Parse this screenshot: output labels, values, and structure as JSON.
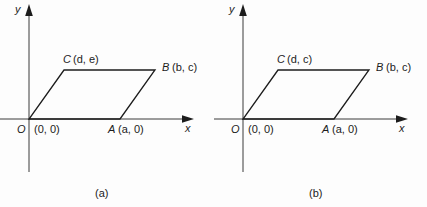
{
  "figures": [
    {
      "caption": "(a)",
      "axes": {
        "y_label": "y",
        "x_label": "x"
      },
      "vertices": [
        {
          "name": "O",
          "label": "O",
          "coord_text": "(0, 0)"
        },
        {
          "name": "A",
          "label": "A",
          "coord_text": "(a, 0)"
        },
        {
          "name": "B",
          "label": "B",
          "coord_text": "(b, c)"
        },
        {
          "name": "C",
          "label": "C",
          "coord_text": "(d, e)"
        }
      ]
    },
    {
      "caption": "(b)",
      "axes": {
        "y_label": "y",
        "x_label": "x"
      },
      "vertices": [
        {
          "name": "O",
          "label": "O",
          "coord_text": "(0, 0)"
        },
        {
          "name": "A",
          "label": "A",
          "coord_text": "(a, 0)"
        },
        {
          "name": "B",
          "label": "B",
          "coord_text": "(b, c)"
        },
        {
          "name": "C",
          "label": "C",
          "coord_text": "(d, c)"
        }
      ]
    }
  ],
  "colors": {
    "background": "#fdfdfd",
    "stroke": "#3a3a3a",
    "shape_stroke": "#1c1c1c",
    "text": "#1c1c1c"
  }
}
